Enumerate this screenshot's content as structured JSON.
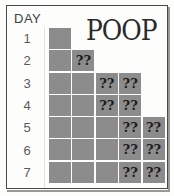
{
  "header": {
    "day_label": "DAY",
    "title": "POOP"
  },
  "colors": {
    "cell_fill": "#8c8c8c",
    "frame_border": "#4a4a4a",
    "page_background": "#fdfdfb",
    "text": "#3d3d3d",
    "mark_text": "#1c1c1c"
  },
  "days": [
    {
      "label": "1"
    },
    {
      "label": "2"
    },
    {
      "label": "3"
    },
    {
      "label": "4"
    },
    {
      "label": "5"
    },
    {
      "label": "6"
    },
    {
      "label": "7"
    }
  ],
  "mark_symbol": "?",
  "chart_data": {
    "type": "bar",
    "title": "POOP",
    "xlabel": "",
    "ylabel": "DAY",
    "categories": [
      "1",
      "2",
      "3",
      "4",
      "5",
      "6",
      "7"
    ],
    "values": [
      1,
      2,
      4,
      4,
      5,
      5,
      5
    ],
    "ylim": [
      0,
      5
    ],
    "grid": false,
    "legend": null,
    "orientation": "horizontal",
    "cells": [
      [
        {
          "filled": true,
          "mark": ""
        }
      ],
      [
        {
          "filled": true,
          "mark": ""
        },
        {
          "filled": true,
          "mark": "?"
        }
      ],
      [
        {
          "filled": true,
          "mark": ""
        },
        {
          "filled": true,
          "mark": ""
        },
        {
          "filled": true,
          "mark": "?"
        },
        {
          "filled": true,
          "mark": "?"
        }
      ],
      [
        {
          "filled": true,
          "mark": ""
        },
        {
          "filled": true,
          "mark": ""
        },
        {
          "filled": true,
          "mark": "?"
        },
        {
          "filled": true,
          "mark": "?"
        }
      ],
      [
        {
          "filled": true,
          "mark": ""
        },
        {
          "filled": true,
          "mark": ""
        },
        {
          "filled": true,
          "mark": ""
        },
        {
          "filled": true,
          "mark": "?"
        },
        {
          "filled": true,
          "mark": "?"
        }
      ],
      [
        {
          "filled": true,
          "mark": ""
        },
        {
          "filled": true,
          "mark": ""
        },
        {
          "filled": true,
          "mark": ""
        },
        {
          "filled": true,
          "mark": "?"
        },
        {
          "filled": true,
          "mark": "?"
        }
      ],
      [
        {
          "filled": true,
          "mark": ""
        },
        {
          "filled": true,
          "mark": ""
        },
        {
          "filled": true,
          "mark": ""
        },
        {
          "filled": true,
          "mark": "?"
        },
        {
          "filled": true,
          "mark": "?"
        }
      ]
    ],
    "annotations": [
      {
        "text": "?",
        "meaning": "unknown-entry-marker"
      }
    ]
  }
}
